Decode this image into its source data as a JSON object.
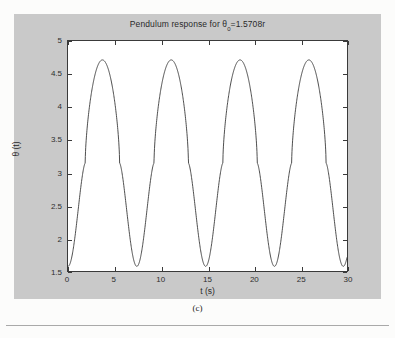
{
  "figure": {
    "caption": "(c)",
    "background_color": "#c9c9c9",
    "axes_background_color": "#ffffff",
    "line_color": "#3a3a3a"
  },
  "chart_data": {
    "type": "line",
    "title_main": "Pendulum response for ",
    "title_symbol": "θ",
    "title_subscript": "0",
    "title_tail": "=1.5708r",
    "xlabel": "t  (s)",
    "ylabel": "θ (t)",
    "xlim": [
      0,
      30
    ],
    "ylim": [
      1.5,
      5
    ],
    "xticks": [
      0,
      5,
      10,
      15,
      20,
      25,
      30
    ],
    "xticklabels": [
      "0",
      "5",
      "10",
      "15",
      "20",
      "25",
      "30"
    ],
    "yticks": [
      1.5,
      2,
      2.5,
      3,
      3.5,
      4,
      4.5,
      5
    ],
    "yticklabels": [
      "1.5",
      "2",
      "2.5",
      "3",
      "3.5",
      "4",
      "4.5",
      "5"
    ],
    "grid": false,
    "legend": null,
    "series": [
      {
        "name": "theta(t)",
        "description": "Nonlinear pendulum oscillation: starts at theta0=1.5708 rad, oscillates between 1.5708 and about 4.712 rad with period about 7.4 s; peaks are broad/rounded and troughs are narrow/cusped.",
        "theta_min": 1.5708,
        "theta_max": 4.712,
        "period_s": 7.4,
        "peaks_t": [
          3.7,
          11.1,
          18.5,
          25.9
        ],
        "troughs_t": [
          0.0,
          7.4,
          14.8,
          22.2,
          29.6
        ],
        "x": [
          0,
          0.2,
          0.4,
          0.6,
          0.8,
          1,
          1.2,
          1.4,
          1.6,
          1.8,
          2,
          2.2,
          2.4,
          2.6,
          2.8,
          3,
          3.2,
          3.4,
          3.6,
          3.8,
          4,
          4.2,
          4.4,
          4.6,
          4.8,
          5,
          5.2,
          5.4,
          5.6,
          5.8,
          6,
          6.2,
          6.4,
          6.6,
          6.8,
          7,
          7.2,
          7.4,
          7.6,
          7.8,
          8,
          8.2,
          8.4,
          8.6,
          8.8,
          9,
          9.2,
          9.4,
          9.6,
          9.8,
          10,
          10.2,
          10.4,
          10.6,
          10.8,
          11,
          11.2,
          11.4,
          11.6,
          11.8,
          12,
          12.2,
          12.4,
          12.6,
          12.8,
          13,
          13.2,
          13.4,
          13.6,
          13.8,
          14,
          14.2,
          14.4,
          14.6,
          14.8,
          15,
          15.2,
          15.4,
          15.6,
          15.8,
          16,
          16.2,
          16.4,
          16.6,
          16.8,
          17,
          17.2,
          17.4,
          17.6,
          17.8,
          18,
          18.2,
          18.4,
          18.6,
          18.8,
          19,
          19.2,
          19.4,
          19.6,
          19.8,
          20,
          20.2,
          20.4,
          20.6,
          20.8,
          21,
          21.2,
          21.4,
          21.6,
          21.8,
          22,
          22.2,
          22.4,
          22.6,
          22.8,
          23,
          23.2,
          23.4,
          23.6,
          23.8,
          24,
          24.2,
          24.4,
          24.6,
          24.8,
          25,
          25.2,
          25.4,
          25.6,
          25.8,
          26,
          26.2,
          26.4,
          26.6,
          26.8,
          27,
          27.2,
          27.4,
          27.6,
          27.8,
          28,
          28.2,
          28.4,
          28.6,
          28.8,
          29,
          29.2,
          29.4,
          29.6,
          29.8,
          30
        ]
      }
    ]
  }
}
